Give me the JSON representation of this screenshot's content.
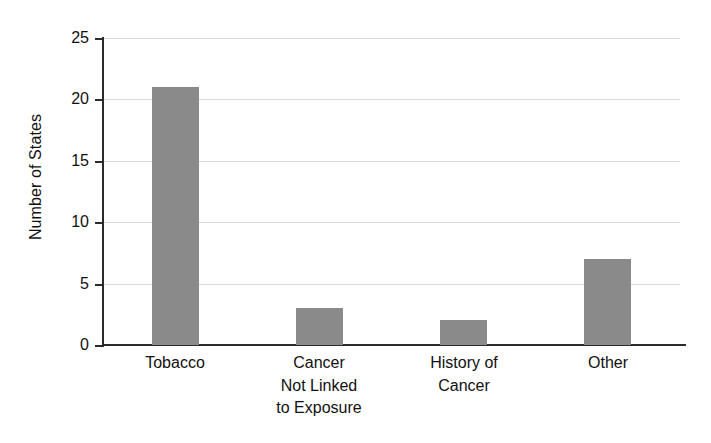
{
  "chart_data": {
    "type": "bar",
    "title": "",
    "subtitle": "",
    "xlabel": "",
    "ylabel": "Number of States",
    "categories": [
      "Tobacco",
      "Cancer Not Linked to Exposure",
      "History of Cancer",
      "Other"
    ],
    "category_label_lines": [
      [
        "Tobacco"
      ],
      [
        "Cancer",
        "Not Linked",
        "to Exposure"
      ],
      [
        "History of",
        "Cancer"
      ],
      [
        "Other"
      ]
    ],
    "values": [
      21,
      3,
      2,
      7
    ],
    "ylim": [
      0,
      25
    ],
    "y_ticks": [
      0,
      5,
      10,
      15,
      20,
      25
    ],
    "y_tick_labels": [
      "0",
      "5",
      "10",
      "15",
      "20",
      "25"
    ],
    "grid": true,
    "grid_axis": "y",
    "legend": false,
    "legend_position": "none",
    "bar_color": "#8a8a8a",
    "gridline_color": "#d9d9d9",
    "axis_color": "#2b2b2b",
    "background_color": "#ffffff"
  }
}
